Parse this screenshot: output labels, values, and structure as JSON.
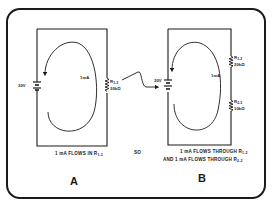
{
  "diagram": {
    "panels": [
      {
        "id": "A",
        "label": "A",
        "source": {
          "voltage": "30V"
        },
        "current_label": "1mA",
        "resistors": [
          {
            "name": "R",
            "subscript": "1-3",
            "value": "30kΩ"
          }
        ],
        "caption": {
          "text": "1 mA FLOWS IN R",
          "subscript": "1-3"
        }
      },
      {
        "id": "B",
        "label": "B",
        "source": {
          "voltage": "30V"
        },
        "current_label": "1mA",
        "resistors": [
          {
            "name": "R",
            "subscript": "1-2",
            "value": "20kΩ"
          },
          {
            "name": "R",
            "subscript": "2-3",
            "value": "10kΩ"
          }
        ],
        "caption_lines": [
          {
            "text": "1 mA FLOWS THROUGH R",
            "subscript": "1-2"
          },
          {
            "text": "AND 1 mA FLOWS THROUGH R",
            "subscript": "2-3"
          }
        ]
      }
    ],
    "connector_text": "SO",
    "colors": {
      "ink": "#1a1a1a",
      "background": "#ffffff"
    }
  }
}
